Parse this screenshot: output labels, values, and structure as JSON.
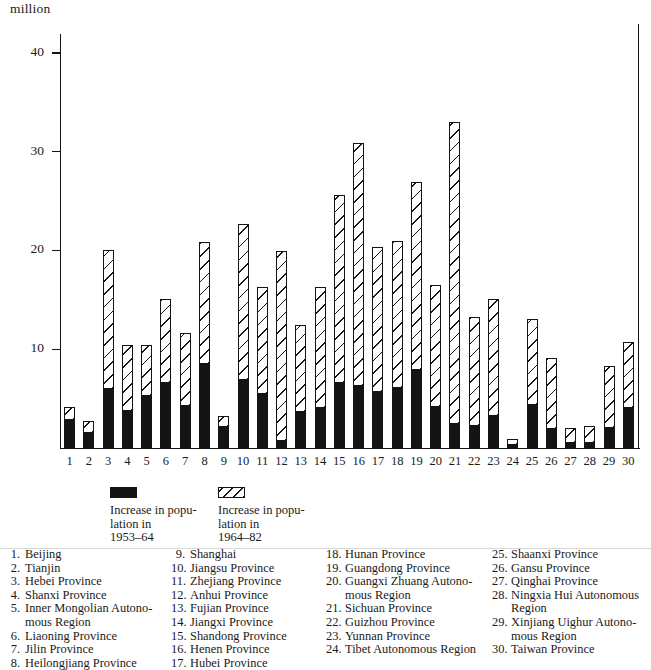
{
  "axis": {
    "unit_label": "million",
    "y_ticks": [
      {
        "label": "40",
        "value": 40
      },
      {
        "label": "30",
        "value": 30
      },
      {
        "label": "20",
        "value": 20
      },
      {
        "label": "10",
        "value": 10
      }
    ],
    "y_min": 0,
    "y_max": 41.5
  },
  "legend": {
    "solid": {
      "swatch": "solid-black-swatch",
      "text": "Increase in popu-\nlation in\n1953–64"
    },
    "hatch": {
      "swatch": "diagonal-hatch-swatch",
      "text": "Increase in popu-\nlation in\n1964–82"
    }
  },
  "key_columns": [
    {
      "items": [
        {
          "num": "1.",
          "name": "Beijing"
        },
        {
          "num": "2.",
          "name": "Tianjin"
        },
        {
          "num": "3.",
          "name": "Hebei Province"
        },
        {
          "num": "4.",
          "name": "Shanxi Province"
        },
        {
          "num": "5.",
          "name": "Inner Mongolian Autono-\nmous Region"
        },
        {
          "num": "6.",
          "name": "Liaoning Province"
        },
        {
          "num": "7.",
          "name": "Jilin Province"
        },
        {
          "num": "8.",
          "name": "Heilongjiang Province"
        }
      ]
    },
    {
      "items": [
        {
          "num": "9.",
          "name": "Shanghai"
        },
        {
          "num": "10.",
          "name": "Jiangsu Province"
        },
        {
          "num": "11.",
          "name": "Zhejiang Province"
        },
        {
          "num": "12.",
          "name": "Anhui Province"
        },
        {
          "num": "13.",
          "name": "Fujian Province"
        },
        {
          "num": "14.",
          "name": "Jiangxi Province"
        },
        {
          "num": "15.",
          "name": "Shandong Province"
        },
        {
          "num": "16.",
          "name": "Henen Province"
        },
        {
          "num": "17.",
          "name": "Hubei Province"
        }
      ]
    },
    {
      "items": [
        {
          "num": "18.",
          "name": "Hunan Province"
        },
        {
          "num": "19.",
          "name": "Guangdong Province"
        },
        {
          "num": "20.",
          "name": "Guangxi Zhuang Autono-\nmous Region"
        },
        {
          "num": "21.",
          "name": "Sichuan Province"
        },
        {
          "num": "22.",
          "name": "Guizhou Province"
        },
        {
          "num": "23.",
          "name": "Yunnan Province"
        },
        {
          "num": "24.",
          "name": "Tibet Autonomous Region"
        }
      ]
    },
    {
      "items": [
        {
          "num": "25.",
          "name": "Shaanxi Province"
        },
        {
          "num": "26.",
          "name": "Gansu Province"
        },
        {
          "num": "27.",
          "name": "Qinghai Province"
        },
        {
          "num": "28.",
          "name": "Ningxia Hui Autonomous\nRegion"
        },
        {
          "num": "29.",
          "name": "Xinjiang Uighur Autono-\nmous Region"
        },
        {
          "num": "30.",
          "name": "Taiwan Province"
        }
      ]
    }
  ],
  "chart_data": {
    "type": "bar",
    "title": "",
    "xlabel": "",
    "ylabel": "million",
    "ylim": [
      0,
      41.5
    ],
    "grid": false,
    "stacked": true,
    "legend_position": "below-plot",
    "categories": [
      "1",
      "2",
      "3",
      "4",
      "5",
      "6",
      "7",
      "8",
      "9",
      "10",
      "11",
      "12",
      "13",
      "14",
      "15",
      "16",
      "17",
      "18",
      "19",
      "20",
      "21",
      "22",
      "23",
      "24",
      "25",
      "26",
      "27",
      "28",
      "29",
      "30"
    ],
    "category_names": [
      "Beijing",
      "Tianjin",
      "Hebei Province",
      "Shanxi Province",
      "Inner Mongolian Autonomous Region",
      "Liaoning Province",
      "Jilin Province",
      "Heilongjiang Province",
      "Shanghai",
      "Jiangsu Province",
      "Zhejiang Province",
      "Anhui Province",
      "Fujian Province",
      "Jiangxi Province",
      "Shandong Province",
      "Henen Province",
      "Hubei Province",
      "Hunan Province",
      "Guangdong Province",
      "Guangxi Zhuang Autonomous Region",
      "Sichuan Province",
      "Guizhou Province",
      "Yunnan Province",
      "Tibet Autonomous Region",
      "Shaanxi Province",
      "Gansu Province",
      "Qinghai Province",
      "Ningxia Hui Autonomous Region",
      "Xinjiang Uighur Autonomous Region",
      "Taiwan Province"
    ],
    "series": [
      {
        "name": "Increase in population in 1953–64",
        "key": "solid",
        "values": [
          2.8,
          1.5,
          6.0,
          3.7,
          5.3,
          6.6,
          4.3,
          8.5,
          2.1,
          6.9,
          5.5,
          0.7,
          3.6,
          4.1,
          6.6,
          6.3,
          5.7,
          6.1,
          7.9,
          4.2,
          2.4,
          2.2,
          3.2,
          0.3,
          4.4,
          1.9,
          0.5,
          0.5,
          2.0,
          4.0
        ]
      },
      {
        "name": "Increase in population in 1964–82",
        "key": "hatch",
        "values": [
          1.4,
          1.2,
          14.0,
          6.7,
          5.1,
          8.5,
          7.3,
          12.4,
          1.1,
          15.8,
          10.8,
          19.2,
          8.9,
          12.2,
          19.0,
          24.6,
          14.6,
          14.9,
          19.0,
          12.3,
          30.6,
          11.1,
          11.9,
          0.6,
          8.7,
          7.2,
          1.5,
          1.7,
          6.3,
          6.7
        ]
      }
    ],
    "totals": [
      4.2,
      2.7,
      20.0,
      10.4,
      10.4,
      15.1,
      11.6,
      20.9,
      3.2,
      22.7,
      16.3,
      19.9,
      12.5,
      16.3,
      25.6,
      30.9,
      20.3,
      21.0,
      26.9,
      16.5,
      33.0,
      13.3,
      15.1,
      0.9,
      13.1,
      9.1,
      2.0,
      2.2,
      8.3,
      10.7
    ]
  }
}
